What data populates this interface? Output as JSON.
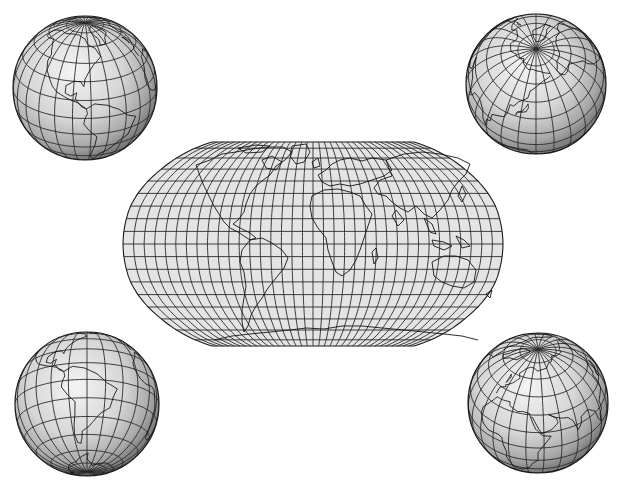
{
  "figure": {
    "width": 621,
    "height": 492,
    "background": "#ffffff",
    "ink_color": "#1e1e1e",
    "land_fill": "none",
    "ocean_fill_light": "#efefef",
    "ocean_fill_dark": "#8f8f8f"
  },
  "world_map": {
    "projection": "robinson-like pseudocylindrical",
    "center": [
      313,
      244
    ],
    "half_width": 190,
    "half_height": 102,
    "fill": "#e4e4e4",
    "meridian_step_deg": 10,
    "parallel_step_deg": 10,
    "central_meridian_deg": 0
  },
  "globes": [
    {
      "id": "globe-top-left",
      "label": "Americas (Northern view)",
      "center": [
        85,
        88
      ],
      "radius": 72,
      "lon0": -80,
      "lat0": 25
    },
    {
      "id": "globe-top-right",
      "label": "Arctic / North Pacific view",
      "center": [
        536,
        84
      ],
      "radius": 70,
      "lon0": 150,
      "lat0": 60
    },
    {
      "id": "globe-bottom-left",
      "label": "South America view",
      "center": [
        87,
        404
      ],
      "radius": 72,
      "lon0": -60,
      "lat0": -20
    },
    {
      "id": "globe-bottom-right",
      "label": "Europe / Africa / Asia view",
      "center": [
        538,
        403
      ],
      "radius": 70,
      "lon0": 40,
      "lat0": 40
    }
  ],
  "graticule": {
    "step_deg": 15,
    "stroke": "#2a2a2a"
  }
}
